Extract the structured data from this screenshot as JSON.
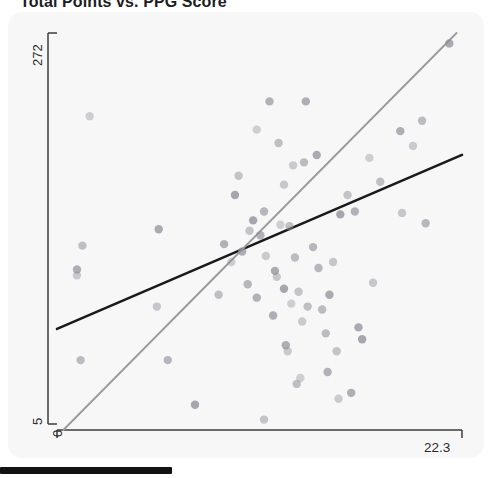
{
  "title": "Total Points vs. PPG Score",
  "axes": {
    "y_max_label": "272",
    "y_min_label": "5",
    "x_min_label": "0",
    "x_max_label": "22.3"
  },
  "scrollbar": {
    "name": "horizontal-scrollbar"
  },
  "colors": {
    "card_background": "#f7f7f7",
    "page_background": "#ffffff",
    "axis": "#3c3c3c",
    "point": "#8c8c96",
    "trend_primary": "#1a1a1a",
    "trend_secondary": "#9a9a9a",
    "scrollbar_thumb": "#121212"
  },
  "chart_data": {
    "type": "scatter",
    "title": "Total Points vs. PPG Score",
    "xlabel": "PPG Score",
    "ylabel": "Total Points",
    "xlim": [
      0,
      22.3
    ],
    "ylim": [
      5,
      272
    ],
    "grid": false,
    "legend": "none",
    "point_color": "#8c8c96",
    "point_radius": 4.2,
    "points": [
      {
        "x": 1.8,
        "y": 216
      },
      {
        "x": 1.4,
        "y": 129
      },
      {
        "x": 1.1,
        "y": 113
      },
      {
        "x": 1.1,
        "y": 109
      },
      {
        "x": 1.3,
        "y": 52
      },
      {
        "x": 5.6,
        "y": 140
      },
      {
        "x": 5.5,
        "y": 88
      },
      {
        "x": 6.1,
        "y": 52
      },
      {
        "x": 7.6,
        "y": 22
      },
      {
        "x": 11.4,
        "y": 12
      },
      {
        "x": 11.7,
        "y": 226
      },
      {
        "x": 11.0,
        "y": 207
      },
      {
        "x": 12.2,
        "y": 198
      },
      {
        "x": 13.7,
        "y": 226
      },
      {
        "x": 13.0,
        "y": 183
      },
      {
        "x": 13.6,
        "y": 185
      },
      {
        "x": 14.3,
        "y": 190
      },
      {
        "x": 12.5,
        "y": 170
      },
      {
        "x": 11.4,
        "y": 152
      },
      {
        "x": 10.8,
        "y": 146
      },
      {
        "x": 10.6,
        "y": 139
      },
      {
        "x": 11.2,
        "y": 136
      },
      {
        "x": 12.3,
        "y": 143
      },
      {
        "x": 12.8,
        "y": 142
      },
      {
        "x": 10.2,
        "y": 125
      },
      {
        "x": 11.5,
        "y": 122
      },
      {
        "x": 13.1,
        "y": 121
      },
      {
        "x": 12.0,
        "y": 112
      },
      {
        "x": 12.1,
        "y": 108
      },
      {
        "x": 10.5,
        "y": 103
      },
      {
        "x": 12.5,
        "y": 100
      },
      {
        "x": 13.3,
        "y": 98
      },
      {
        "x": 11.0,
        "y": 94
      },
      {
        "x": 12.9,
        "y": 90
      },
      {
        "x": 13.8,
        "y": 88
      },
      {
        "x": 11.9,
        "y": 82
      },
      {
        "x": 13.5,
        "y": 78
      },
      {
        "x": 14.6,
        "y": 86
      },
      {
        "x": 15.0,
        "y": 96
      },
      {
        "x": 15.2,
        "y": 118
      },
      {
        "x": 14.1,
        "y": 128
      },
      {
        "x": 15.6,
        "y": 150
      },
      {
        "x": 16.0,
        "y": 163
      },
      {
        "x": 16.4,
        "y": 152
      },
      {
        "x": 17.2,
        "y": 188
      },
      {
        "x": 17.8,
        "y": 172
      },
      {
        "x": 18.9,
        "y": 206
      },
      {
        "x": 19.6,
        "y": 196
      },
      {
        "x": 20.1,
        "y": 213
      },
      {
        "x": 21.6,
        "y": 265
      },
      {
        "x": 19.0,
        "y": 151
      },
      {
        "x": 20.3,
        "y": 144
      },
      {
        "x": 16.8,
        "y": 66
      },
      {
        "x": 15.4,
        "y": 58
      },
      {
        "x": 14.9,
        "y": 44
      },
      {
        "x": 13.4,
        "y": 40
      },
      {
        "x": 13.2,
        "y": 36
      },
      {
        "x": 16.2,
        "y": 30
      },
      {
        "x": 15.5,
        "y": 26
      },
      {
        "x": 14.8,
        "y": 70
      },
      {
        "x": 16.6,
        "y": 74
      },
      {
        "x": 17.4,
        "y": 104
      },
      {
        "x": 14.4,
        "y": 114
      },
      {
        "x": 9.8,
        "y": 163
      },
      {
        "x": 10.0,
        "y": 176
      },
      {
        "x": 9.2,
        "y": 130
      },
      {
        "x": 9.6,
        "y": 118
      },
      {
        "x": 8.9,
        "y": 96
      },
      {
        "x": 12.6,
        "y": 62
      },
      {
        "x": 12.7,
        "y": 58
      }
    ],
    "trend_lines": [
      {
        "name": "primary-fit-line",
        "color": "#1a1a1a",
        "width": 2.6,
        "x_start": 0.0,
        "y_start": 73,
        "x_end": 22.3,
        "y_end": 190
      },
      {
        "name": "secondary-fit-line",
        "color": "#9a9a9a",
        "width": 1.8,
        "x_start": 0.35,
        "y_start": 5,
        "x_end": 22.0,
        "y_end": 272
      }
    ]
  }
}
